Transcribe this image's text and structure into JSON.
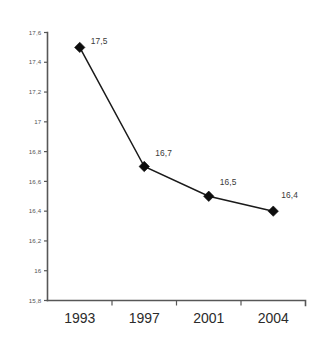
{
  "chart_data": {
    "type": "line",
    "title": "",
    "subtitle": "",
    "xlabel": "",
    "ylabel": "",
    "categories": [
      "1993",
      "1997",
      "2001",
      "2004"
    ],
    "values": [
      17.5,
      16.7,
      16.5,
      16.4
    ],
    "point_labels": [
      "17,5",
      "16,7",
      "16,5",
      "16,4"
    ],
    "ylim": [
      15.8,
      17.6
    ],
    "ytick_values": [
      17.6,
      17.4,
      17.2,
      17.0,
      16.8,
      16.6,
      16.4,
      16.2,
      16.0,
      15.8
    ],
    "ytick_labels": [
      "17,6",
      "17,4",
      "17,2",
      "17",
      "16,8",
      "16,6",
      "16,4",
      "16,2",
      "16",
      "15,8"
    ],
    "grid": false,
    "legend": false,
    "legend_position": "none",
    "marker": "diamond",
    "decimal_separator": ",",
    "series": [
      {
        "name": "series-1",
        "values": [
          17.5,
          16.7,
          16.5,
          16.4
        ],
        "labels": [
          "17,5",
          "16,7",
          "16,5",
          "16,4"
        ]
      }
    ],
    "colors": {
      "line": "#1a1a1a",
      "marker": "#0d0d0d",
      "axis": "#575757",
      "tick_label": "#555555",
      "category_label": "#2b2b2b",
      "point_label": "#3a3a3a",
      "background": "#ffffff"
    }
  }
}
